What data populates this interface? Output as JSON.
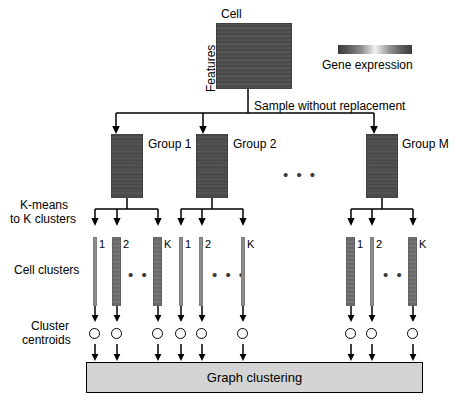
{
  "diagram": {
    "top": {
      "matrix_col_label": "Cell",
      "matrix_row_label": "Features",
      "legend_label": "Gene expression",
      "legend_icon": "grayscale-colorbar"
    },
    "sampling": {
      "label": "Sample without replacement",
      "arrow_icon": "down-arrow"
    },
    "groups": [
      {
        "label": "Group 1",
        "id": "group-1"
      },
      {
        "label": "Group 2",
        "id": "group-2"
      },
      {
        "label": "Group M",
        "id": "group-m"
      }
    ],
    "groups_ellipsis": "• • •",
    "kmeans": {
      "line1": "K-means",
      "line2": "to K clusters"
    },
    "cell_clusters": {
      "label": "Cell clusters",
      "tick_labels": [
        "1",
        "2",
        "K"
      ],
      "ellipsis": "• • •",
      "bar_styles": {
        "group-1": [
          "thin",
          "thick",
          "thick"
        ],
        "group-2": [
          "thin",
          "thin",
          "thin"
        ],
        "group-m": [
          "thick",
          "thin",
          "thick"
        ]
      }
    },
    "centroids": {
      "line1": "Cluster",
      "line2": "centroids",
      "circle_icon": "open-circle"
    },
    "output": {
      "label": "Graph clustering"
    },
    "colors": {
      "heatmap_base": "#4a4a4a",
      "cluster_bar_thin": "#8c8c8c",
      "cluster_bar_thick": "#6f6f6f",
      "output_box_fill": "#d4d4d4",
      "stroke": "#000000",
      "background": "#ffffff"
    }
  }
}
